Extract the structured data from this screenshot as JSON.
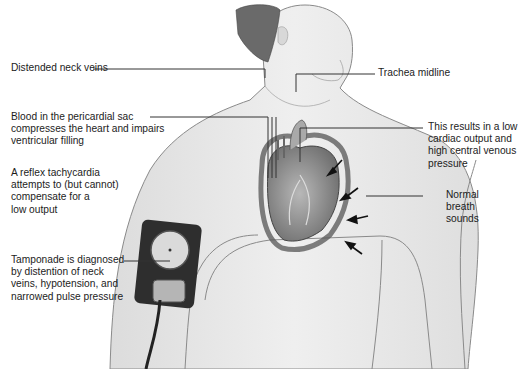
{
  "figure": {
    "labels": {
      "neck_veins": "Distended neck veins",
      "trachea": "Trachea midline",
      "pericardial": "Blood in the pericardial sac\ncompresses the heart and impairs\nventricular filling",
      "low_output": "This results in a low\ncardiac output and\nhigh central venous\npressure",
      "tachycardia": "A reflex tachycardia\nattempts to (but cannot)\ncompensate for a\nlow output",
      "breath_sounds": "Normal\nbreath\nsounds",
      "diagnosis": "Tamponade is diagnosed\nby distention of neck\nveins, hypotension, and\nnarrowed pulse pressure"
    },
    "icons": [
      "heart-illustration",
      "blood-pressure-cuff-icon",
      "compression-arrow-icon"
    ],
    "colors": {
      "skin": "#e9e9e9",
      "outline": "#8a8a8a",
      "cuff": "#2e2e2e",
      "heart": "#9a9a9a",
      "leader": "#333333"
    }
  }
}
